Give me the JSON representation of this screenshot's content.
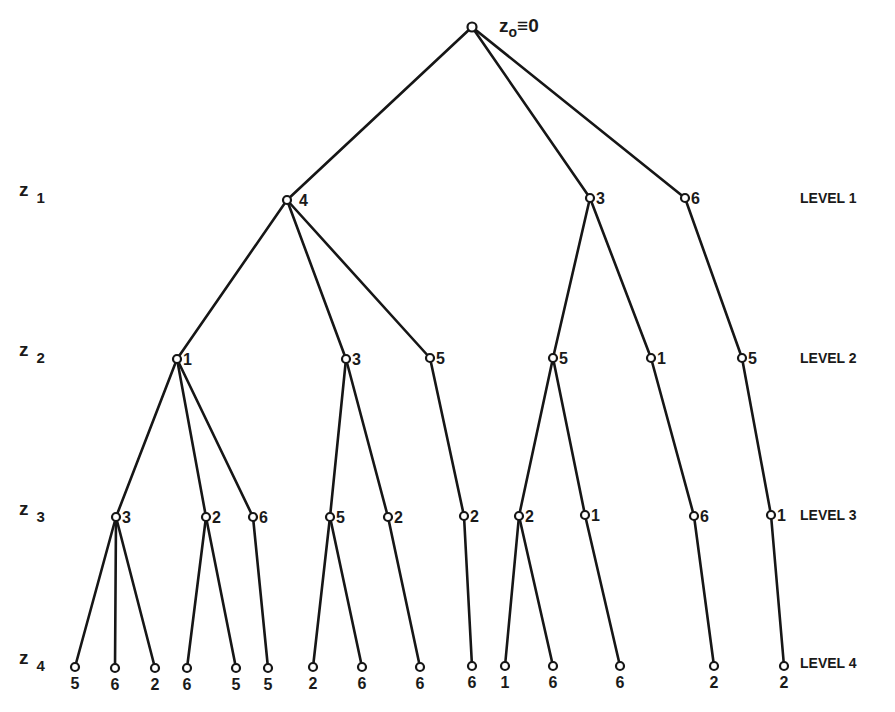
{
  "diagram": {
    "type": "search-tree",
    "root": {
      "label_main": "z",
      "label_sub": "o",
      "label_rest": "≡0",
      "x": 472,
      "y": 27
    },
    "row_labels": [
      {
        "main": "z",
        "sub": "1",
        "y": 196
      },
      {
        "main": "z",
        "sub": "2",
        "y": 356
      },
      {
        "main": "z",
        "sub": "3",
        "y": 515
      },
      {
        "main": "z",
        "sub": "4",
        "y": 664
      }
    ],
    "level_labels": [
      {
        "text": "LEVEL 1",
        "y": 203
      },
      {
        "text": "LEVEL 2",
        "y": 363
      },
      {
        "text": "LEVEL 3",
        "y": 520
      },
      {
        "text": "LEVEL 4",
        "y": 668
      }
    ],
    "nodes": {
      "level1": [
        {
          "id": "a",
          "label": "4",
          "x": 287,
          "y": 200,
          "parent": "root",
          "dx": 12
        },
        {
          "id": "b",
          "label": "3",
          "x": 590,
          "y": 198,
          "parent": "root",
          "dx": 6
        },
        {
          "id": "c",
          "label": "6",
          "x": 685,
          "y": 198,
          "parent": "root",
          "dx": 6
        }
      ],
      "level2": [
        {
          "id": "a1",
          "label": "1",
          "x": 177,
          "y": 359,
          "parent": "a"
        },
        {
          "id": "a2",
          "label": "3",
          "x": 346,
          "y": 359,
          "parent": "a"
        },
        {
          "id": "a3",
          "label": "5",
          "x": 430,
          "y": 358,
          "parent": "a"
        },
        {
          "id": "b1",
          "label": "5",
          "x": 553,
          "y": 358,
          "parent": "b"
        },
        {
          "id": "b2",
          "label": "1",
          "x": 651,
          "y": 358,
          "parent": "b"
        },
        {
          "id": "c1",
          "label": "5",
          "x": 742,
          "y": 358,
          "parent": "c"
        }
      ],
      "level3": [
        {
          "id": "a1a",
          "label": "3",
          "x": 116,
          "y": 517,
          "parent": "a1"
        },
        {
          "id": "a1b",
          "label": "2",
          "x": 206,
          "y": 517,
          "parent": "a1"
        },
        {
          "id": "a1c",
          "label": "6",
          "x": 253,
          "y": 517,
          "parent": "a1"
        },
        {
          "id": "a2a",
          "label": "5",
          "x": 330,
          "y": 517,
          "parent": "a2"
        },
        {
          "id": "a2b",
          "label": "2",
          "x": 388,
          "y": 517,
          "parent": "a2"
        },
        {
          "id": "a3a",
          "label": "2",
          "x": 464,
          "y": 516,
          "parent": "a3"
        },
        {
          "id": "b1a",
          "label": "2",
          "x": 519,
          "y": 516,
          "parent": "b1"
        },
        {
          "id": "b1b",
          "label": "1",
          "x": 585,
          "y": 515,
          "parent": "b1"
        },
        {
          "id": "b2a",
          "label": "6",
          "x": 694,
          "y": 516,
          "parent": "b2"
        },
        {
          "id": "c1a",
          "label": "1",
          "x": 771,
          "y": 515,
          "parent": "c1"
        }
      ],
      "level4": [
        {
          "label": "5",
          "x": 75,
          "y": 667,
          "parent": "a1a"
        },
        {
          "label": "6",
          "x": 115,
          "y": 668,
          "parent": "a1a"
        },
        {
          "label": "2",
          "x": 155,
          "y": 668,
          "parent": "a1a"
        },
        {
          "label": "6",
          "x": 187,
          "y": 668,
          "parent": "a1b"
        },
        {
          "label": "5",
          "x": 236,
          "y": 668,
          "parent": "a1b"
        },
        {
          "label": "5",
          "x": 268,
          "y": 668,
          "parent": "a1c"
        },
        {
          "label": "2",
          "x": 313,
          "y": 667,
          "parent": "a2a"
        },
        {
          "label": "6",
          "x": 362,
          "y": 667,
          "parent": "a2a"
        },
        {
          "label": "6",
          "x": 420,
          "y": 667,
          "parent": "a2b"
        },
        {
          "label": "6",
          "x": 472,
          "y": 666,
          "parent": "a3a"
        },
        {
          "label": "1",
          "x": 505,
          "y": 666,
          "parent": "b1a"
        },
        {
          "label": "6",
          "x": 553,
          "y": 666,
          "parent": "b1a"
        },
        {
          "label": "6",
          "x": 620,
          "y": 666,
          "parent": "b1b"
        },
        {
          "label": "2",
          "x": 714,
          "y": 666,
          "parent": "b2a"
        },
        {
          "label": "2",
          "x": 784,
          "y": 666,
          "parent": "c1a"
        }
      ]
    },
    "colors": {
      "ink": "#161616",
      "background": "#ffffff",
      "caption": "#cfcfcf"
    }
  }
}
